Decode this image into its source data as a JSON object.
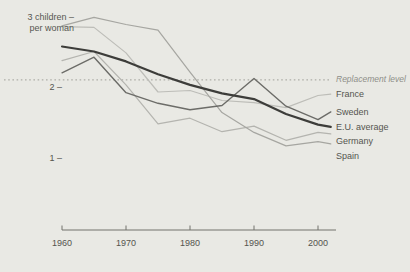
{
  "page": {
    "background_color": "#e9e9e4",
    "text_color": "#55554f",
    "axis_color": "#73736c",
    "dotted_line_color": "#a0a09a",
    "replacement_label_color": "#8f8f89"
  },
  "chart_data": {
    "type": "line",
    "title": "",
    "unit_label_lines": [
      "3 children –",
      "per woman"
    ],
    "xlabel": "",
    "ylabel": "children per woman",
    "xlim": [
      1960,
      2002.5
    ],
    "ylim": [
      0.8,
      3.15
    ],
    "grid": false,
    "legend_position": "right-of-line-ends",
    "x_ticks": [
      1960,
      1970,
      1980,
      1990,
      2000
    ],
    "y_ticks": [
      {
        "value": 2,
        "label": "2 –"
      },
      {
        "value": 1,
        "label": "1 –"
      }
    ],
    "unit_label_value": 3,
    "replacement_line": {
      "value": 2.1,
      "label": "Replacement level",
      "style": "dotted"
    },
    "x": [
      1960,
      1965,
      1970,
      1975,
      1980,
      1985,
      1990,
      1995,
      2000,
      2002
    ],
    "series": [
      {
        "name": "France",
        "color": "#bdbdb8",
        "width": 1.2,
        "values": [
          2.85,
          2.84,
          2.48,
          1.93,
          1.95,
          1.81,
          1.78,
          1.71,
          1.88,
          1.9
        ]
      },
      {
        "name": "Germany",
        "color": "#b4b4af",
        "width": 1.2,
        "values": [
          2.37,
          2.5,
          2.03,
          1.48,
          1.56,
          1.37,
          1.45,
          1.25,
          1.36,
          1.34
        ]
      },
      {
        "name": "Spain",
        "color": "#a6a6a1",
        "width": 1.2,
        "values": [
          2.86,
          2.98,
          2.88,
          2.8,
          2.21,
          1.64,
          1.36,
          1.17,
          1.23,
          1.2
        ]
      },
      {
        "name": "Sweden",
        "color": "#6c6c68",
        "width": 1.4,
        "values": [
          2.2,
          2.42,
          1.92,
          1.77,
          1.68,
          1.74,
          2.12,
          1.73,
          1.54,
          1.65
        ]
      },
      {
        "name": "E.U. average",
        "color": "#3d3d3a",
        "width": 2.2,
        "values": [
          2.57,
          2.5,
          2.36,
          2.18,
          2.03,
          1.91,
          1.83,
          1.62,
          1.47,
          1.44
        ]
      }
    ]
  }
}
